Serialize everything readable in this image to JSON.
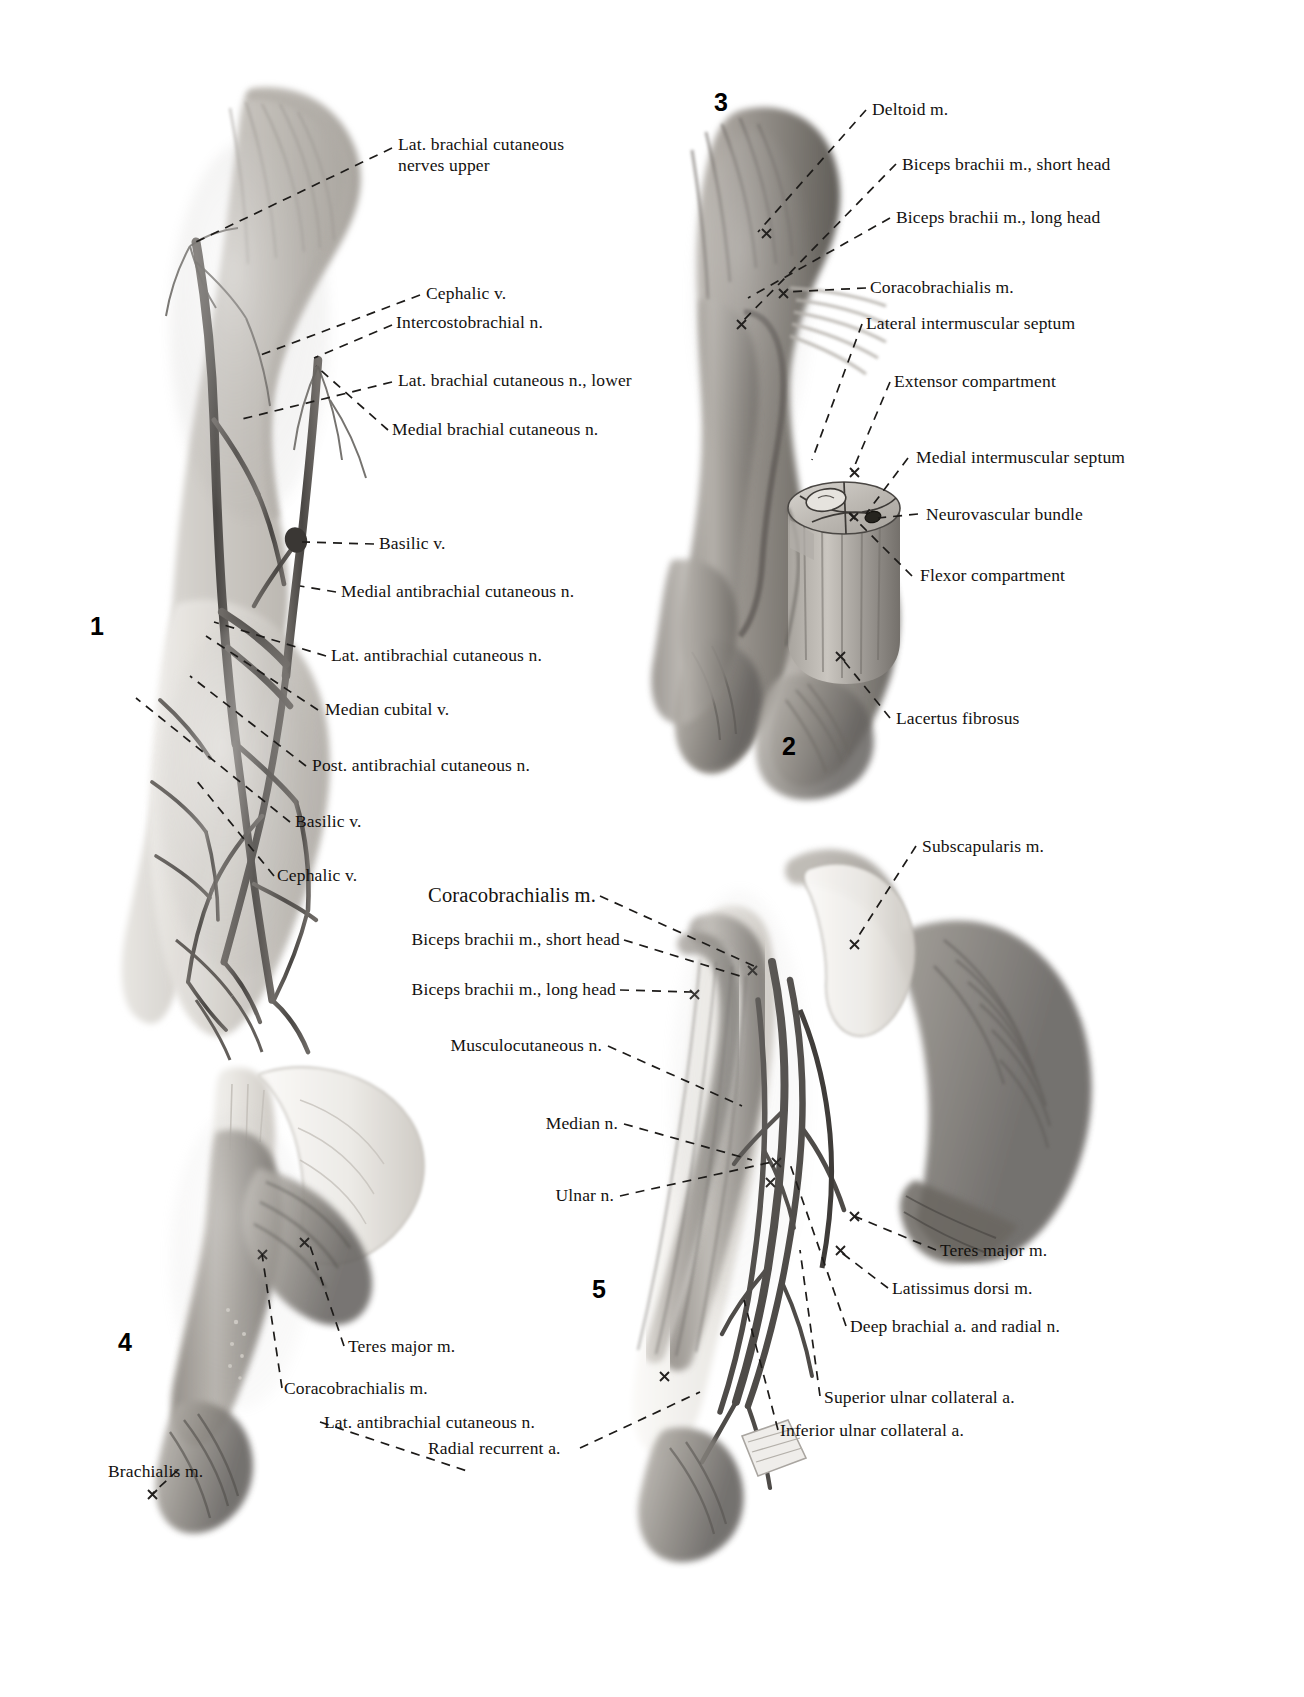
{
  "plate": {
    "kind": "anatomical-atlas-plate",
    "region": "Upper arm / brachium",
    "background": "#ffffff",
    "ink": "#13110f"
  },
  "figures": [
    {
      "number": "1",
      "caption_number_only": true,
      "subject": "Superficial veins and cutaneous nerves of the arm"
    },
    {
      "number": "2",
      "caption_number_only": true,
      "subject": "Cross-section of arm showing compartments"
    },
    {
      "number": "3",
      "caption_number_only": true,
      "subject": "Anterior muscles of the arm"
    },
    {
      "number": "4",
      "caption_number_only": true,
      "subject": "Coracobrachialis and brachialis, posterior scapular view"
    },
    {
      "number": "5",
      "caption_number_only": true,
      "subject": "Deep dissection of arm with neurovascular structures"
    }
  ],
  "labels": {
    "fig1": [
      {
        "text": "Lat. brachial cutaneous\nnerves upper",
        "align": "left"
      },
      {
        "text": "Cephalic v.",
        "align": "left"
      },
      {
        "text": "Intercostobrachial n.",
        "align": "left"
      },
      {
        "text": "Lat. brachial cutaneous n., lower",
        "align": "left"
      },
      {
        "text": "Medial brachial cutaneous n.",
        "align": "left"
      },
      {
        "text": "Basilic v.",
        "align": "left"
      },
      {
        "text": "Medial antibrachial cutaneous n.",
        "align": "left"
      },
      {
        "text": "Lat. antibrachial cutaneous n.",
        "align": "left"
      },
      {
        "text": "Median cubital v.",
        "align": "left"
      },
      {
        "text": "Post. antibrachial cutaneous n.",
        "align": "left"
      },
      {
        "text": "Basilic v.",
        "align": "left"
      },
      {
        "text": "Cephalic v.",
        "align": "left"
      }
    ],
    "fig3": [
      {
        "text": "Deltoid m.",
        "align": "left"
      },
      {
        "text": "Biceps brachii m., short head",
        "align": "left"
      },
      {
        "text": "Biceps brachii m., long head",
        "align": "left"
      },
      {
        "text": "Coracobrachialis m.",
        "align": "left"
      },
      {
        "text": "Lateral intermuscular septum",
        "align": "left"
      }
    ],
    "fig2": [
      {
        "text": "Extensor compartment",
        "align": "left"
      },
      {
        "text": "Medial intermuscular septum",
        "align": "left"
      },
      {
        "text": "Neurovascular bundle",
        "align": "left"
      },
      {
        "text": "Flexor compartment",
        "align": "left"
      },
      {
        "text": "Lacertus fibrosus",
        "align": "left"
      }
    ],
    "fig5_left": [
      {
        "text": "Coracobrachialis m.",
        "align": "right",
        "emphasis": "large"
      },
      {
        "text": "Biceps brachii m., short head",
        "align": "right"
      },
      {
        "text": "Biceps brachii m., long head",
        "align": "right"
      },
      {
        "text": "Musculocutaneous n.",
        "align": "right"
      },
      {
        "text": "Median n.",
        "align": "right"
      },
      {
        "text": "Ulnar n.",
        "align": "right"
      }
    ],
    "fig5_right": [
      {
        "text": "Subscapularis m.",
        "align": "left"
      },
      {
        "text": "Teres major m.",
        "align": "left"
      },
      {
        "text": "Latissimus dorsi m.",
        "align": "left"
      },
      {
        "text": "Deep brachial a. and radial n.",
        "align": "left"
      },
      {
        "text": "Superior ulnar collateral a.",
        "align": "left"
      },
      {
        "text": "Inferior ulnar collateral a.",
        "align": "left"
      }
    ],
    "fig4": [
      {
        "text": "Teres major m.",
        "align": "left"
      },
      {
        "text": "Coracobrachialis m.",
        "align": "left"
      },
      {
        "text": "Lat. antibrachial cutaneous n.",
        "align": "left"
      },
      {
        "text": "Brachialis m.",
        "align": "left"
      },
      {
        "text": "Radial recurrent a.",
        "align": "left"
      }
    ]
  }
}
